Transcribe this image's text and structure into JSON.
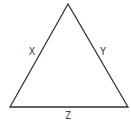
{
  "diagram": {
    "type": "triangle",
    "vertices": {
      "apex": {
        "x": 68,
        "y": 4
      },
      "bottom_left": {
        "x": 10,
        "y": 107
      },
      "bottom_right": {
        "x": 128,
        "y": 107
      }
    },
    "sides": {
      "left": {
        "label": "X"
      },
      "right": {
        "label": "Y"
      },
      "bottom": {
        "label": "Z"
      }
    },
    "stroke_color": "#333333",
    "label_color": "#444444"
  }
}
